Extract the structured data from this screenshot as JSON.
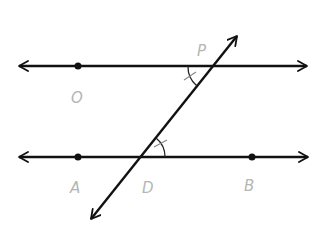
{
  "diagram": {
    "type": "parallel-lines-transversal",
    "colors": {
      "line": "#111111",
      "label": "#b5b5b5",
      "background": "#ffffff"
    },
    "lines": {
      "top": {
        "name": "line-OP",
        "y": 66,
        "x1": 18,
        "x2": 308
      },
      "bottom": {
        "name": "line-AB",
        "y": 157,
        "x1": 18,
        "x2": 309
      },
      "transversal": {
        "name": "line-PD",
        "x1": 90,
        "y1": 220,
        "x2": 238,
        "y2": 35
      }
    },
    "points": [
      {
        "id": "O",
        "label": "O",
        "x": 78,
        "y": 66,
        "dot": true,
        "label_x": 71,
        "label_y": 103
      },
      {
        "id": "P",
        "label": "P",
        "x": 213,
        "y": 66,
        "dot": false,
        "label_x": 197,
        "label_y": 56
      },
      {
        "id": "A",
        "label": "A",
        "x": 78,
        "y": 157,
        "dot": true,
        "label_x": 70,
        "label_y": 193
      },
      {
        "id": "D",
        "label": "D",
        "x": 141,
        "y": 157,
        "dot": false,
        "label_x": 142,
        "label_y": 193
      },
      {
        "id": "B",
        "label": "B",
        "x": 252,
        "y": 157,
        "dot": true,
        "label_x": 244,
        "label_y": 191
      }
    ],
    "angle_marks": [
      {
        "at": "P",
        "between": [
          "PO",
          "PD"
        ],
        "ticks": 1
      },
      {
        "at": "D",
        "between": [
          "DB",
          "DP"
        ],
        "ticks": 1
      }
    ]
  }
}
